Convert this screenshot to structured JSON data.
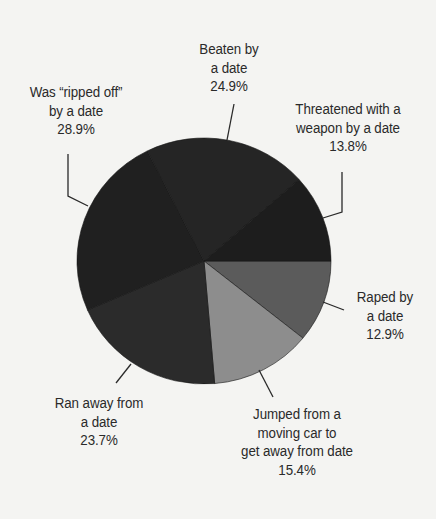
{
  "chart_data": {
    "type": "pie",
    "title": "",
    "start_angle_deg": 0,
    "direction": "clockwise",
    "note": "Percentages as labeled (sum 119.6%, multiple responses); slices drawn proportionally to labeled values",
    "categories": [
      "Raped by a date",
      "Jumped from a moving car to get away from date",
      "Ran away from a date",
      "Was “ripped off” by a date",
      "Beaten by a date",
      "Threatened with a weapon by a date"
    ],
    "values": [
      12.9,
      15.4,
      23.7,
      28.9,
      24.9,
      13.8
    ],
    "unit": "%",
    "colors": [
      "#5b5b5b",
      "#8d8d8d",
      "#2b2b2b",
      "#202020",
      "#252525",
      "#1d1d1d"
    ],
    "labels": [
      {
        "lines": [
          "Raped by",
          "a date",
          "12.9%"
        ]
      },
      {
        "lines": [
          "Jumped from a",
          "moving car to",
          "get away from date",
          "15.4%"
        ]
      },
      {
        "lines": [
          "Ran away from",
          "a date",
          "23.7%"
        ]
      },
      {
        "lines": [
          "Was “ripped off”",
          "by a date",
          "28.9%"
        ]
      },
      {
        "lines": [
          "Beaten by",
          "a date",
          "24.9%"
        ]
      },
      {
        "lines": [
          "Threatened with a",
          "weapon by a date",
          "13.8%"
        ]
      }
    ],
    "legend": "none (direct labels with leader lines)"
  },
  "style": {
    "background": "#f4f4f2",
    "text_color": "#2a2a2a",
    "leader_color": "#2a2a2a"
  }
}
